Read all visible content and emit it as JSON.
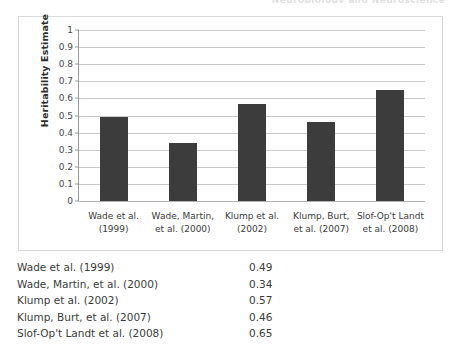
{
  "page": {
    "running_head": "Neurobiology and Neuroscience",
    "background_color": "#ffffff"
  },
  "figure": {
    "border_color": "#d9d9d9",
    "bar_color": "#3c3c3c",
    "gridline_color": "#c9c9c9",
    "axis_color": "#9a9a9a"
  },
  "chart_data": {
    "type": "bar",
    "title": "",
    "xlabel": "",
    "ylabel": "Heritability Estimate",
    "ylim": [
      0,
      1
    ],
    "ytick_step": 0.1,
    "grid": true,
    "legend": "none",
    "categories": [
      "Wade et al. (1999)",
      "Wade, Martin, et al. (2000)",
      "Klump et al. (2002)",
      "Klump, Burt, et al. (2007)",
      "Slof-Op't Landt et al. (2008)"
    ],
    "category_lines": [
      [
        "Wade et al.",
        "(1999)"
      ],
      [
        "Wade, Martin,",
        "et al. (2000)"
      ],
      [
        "Klump et al.",
        "(2002)"
      ],
      [
        "Klump, Burt,",
        "et al. (2007)"
      ],
      [
        "Slof-Op't Landt",
        "et al. (2008)"
      ]
    ],
    "values": [
      0.49,
      0.34,
      0.57,
      0.46,
      0.65
    ],
    "ytick_labels": [
      "1",
      "0.9",
      "0.8",
      "0.7",
      "0.6",
      "0.5",
      "0.4",
      "0.3",
      "0.2",
      "0.1",
      "0"
    ],
    "ytick_values": [
      1,
      0.9,
      0.8,
      0.7,
      0.6,
      0.5,
      0.4,
      0.3,
      0.2,
      0.1,
      0
    ]
  },
  "table": {
    "rows": [
      {
        "study": "Wade et al. (1999)",
        "value": "0.49"
      },
      {
        "study": "Wade, Martin, et al. (2000)",
        "value": "0.34"
      },
      {
        "study": "Klump et al. (2002)",
        "value": "0.57"
      },
      {
        "study": "Klump, Burt, et al. (2007)",
        "value": "0.46"
      },
      {
        "study": "Slof-Op't Landt et al. (2008)",
        "value": "0.65"
      }
    ]
  }
}
